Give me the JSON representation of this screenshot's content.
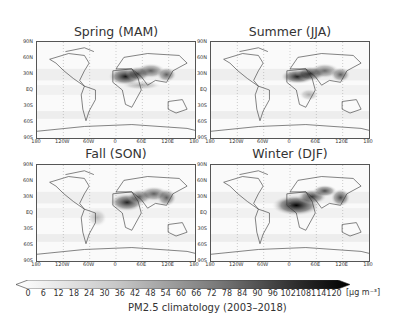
{
  "chart_data": {
    "type": "heatmap",
    "panels": [
      {
        "title": "Spring (MAM)",
        "hotspots": [
          "Sahara/North Africa",
          "Middle East",
          "South Asia",
          "East China"
        ],
        "peak_region": "Sahara/Sahel"
      },
      {
        "title": "Summer (JJA)",
        "hotspots": [
          "Sahara/North Africa",
          "Middle East",
          "South Asia",
          "East China"
        ],
        "peak_region": "Sahara"
      },
      {
        "title": "Fall (SON)",
        "hotspots": [
          "Sahara/Sahel",
          "Middle East",
          "South Asia",
          "East China"
        ],
        "peak_region": "Sahel"
      },
      {
        "title": "Winter (DJF)",
        "hotspots": [
          "Sahel/Gulf of Guinea",
          "Middle East",
          "South Asia",
          "East China"
        ],
        "peak_region": "Sahel/West Africa"
      }
    ],
    "xaxis": {
      "ticks": [
        "180",
        "120W",
        "60W",
        "0",
        "60E",
        "120E",
        "180"
      ]
    },
    "yaxis": {
      "ticks": [
        "90N",
        "60N",
        "30N",
        "EQ",
        "30S",
        "60S",
        "90S"
      ]
    },
    "colorbar": {
      "ticks": [
        0,
        6,
        12,
        18,
        24,
        30,
        36,
        42,
        48,
        54,
        60,
        66,
        72,
        78,
        84,
        90,
        96,
        102,
        108,
        114,
        120
      ],
      "unit": "[μg m⁻³]",
      "colormap": "white-to-black",
      "extend": "both",
      "range": [
        0,
        120
      ]
    },
    "xlabel": "",
    "ylabel": "",
    "grid": "dotted meridians/parallels"
  },
  "figure": {
    "caption": "PM2.5 climatology (2003–2018)",
    "unit_label": "[μg m⁻³]",
    "panels": [
      {
        "title": "Spring (MAM)"
      },
      {
        "title": "Summer (JJA)"
      },
      {
        "title": "Fall (SON)"
      },
      {
        "title": "Winter (DJF)"
      }
    ],
    "lat_ticks": [
      "90N",
      "60N",
      "30N",
      "EQ",
      "30S",
      "60S",
      "90S"
    ],
    "lon_ticks": [
      "180",
      "120W",
      "60W",
      "0",
      "60E",
      "120E",
      "180"
    ],
    "cbar_ticks": [
      "0",
      "6",
      "12",
      "18",
      "24",
      "30",
      "36",
      "42",
      "48",
      "54",
      "60",
      "66",
      "72",
      "78",
      "84",
      "90",
      "96",
      "102",
      "108",
      "114",
      "120"
    ]
  }
}
